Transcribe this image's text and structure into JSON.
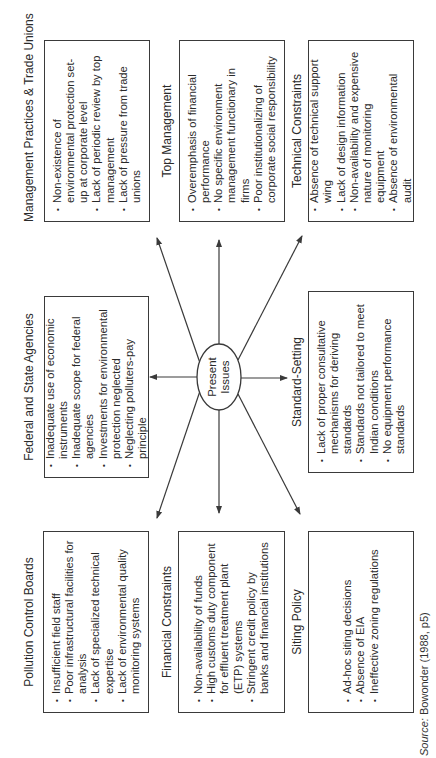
{
  "diagram": {
    "center": {
      "label_line1": "Present",
      "label_line2": "Issues"
    },
    "boxes": {
      "management": {
        "title": "Management Practices & Trade Unions",
        "items": [
          "Non-existence of environmental protection set-up at corporate level",
          "Lack of periodic review by top management",
          "Lack of pressure from trade unions"
        ]
      },
      "top_management": {
        "title": "Top Management",
        "items": [
          "Overemphasis of financial performance",
          "No specific environment management functionary in firms",
          "Poor institutionalizing of corporate social responsibility"
        ]
      },
      "technical": {
        "title": "Technical Constraints",
        "items": [
          "Absence of technical support wing",
          "Lack of design information",
          "Non-availability and expensive nature of monitoring equipment",
          "Absence of environmental audit"
        ]
      },
      "federal": {
        "title": "Federal and State Agencies",
        "items": [
          "Inadequate use of economic instruments",
          "Inadequate scope for federal agencies",
          "Investments for environmental protection neglected",
          "Neglecting polluters-pay principle"
        ]
      },
      "standard": {
        "title": "Standard-Setting",
        "items": [
          "Lack of proper consultative mechanisms for deriving standards",
          "Standards not tailored to meet Indian conditions",
          "No equipment performance standards"
        ]
      },
      "pollution": {
        "title": "Pollution Control Boards",
        "items": [
          "Insufficient field staff",
          "Poor infrastructural facilities for analysis",
          "Lack of specialized technical expertise",
          "Lack of environmental quality monitoring systems"
        ]
      },
      "financial": {
        "title": "Financial Constraints",
        "items": [
          "Non-availability of funds",
          "High customs duty component for effluent treatment plant (ETP) systems",
          "Stringent credit policy by banks and financial institutions"
        ]
      },
      "siting": {
        "title": "Siting Policy",
        "items": [
          "Ad-hoc siting decisions",
          "Absence of EIA",
          "Ineffective zoning regulations"
        ]
      }
    },
    "source": {
      "label": "Source:",
      "text": " Bowonder (1988, p5)"
    },
    "colors": {
      "line": "#3a3a3a",
      "text": "#2a2a2a",
      "background": "#ffffff"
    }
  }
}
